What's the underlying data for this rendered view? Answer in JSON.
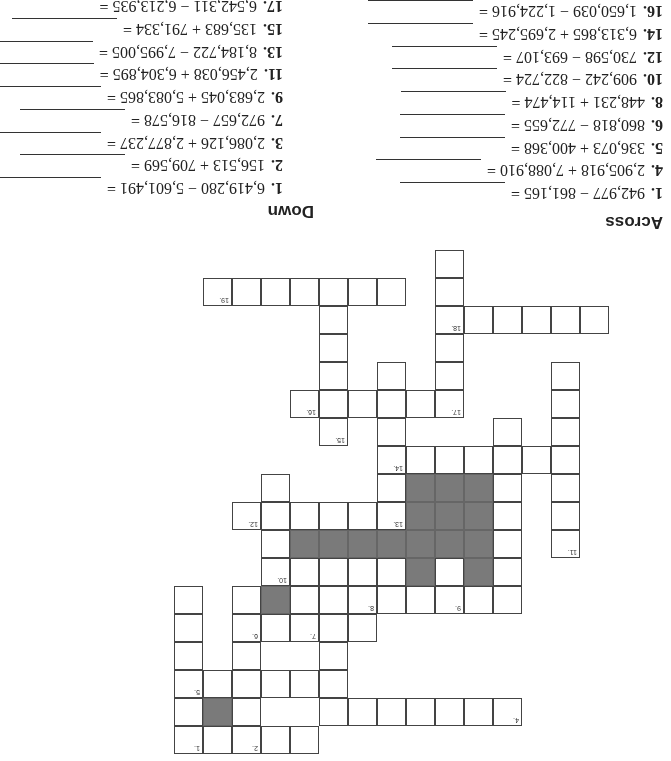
{
  "headings": {
    "across": "Across",
    "down": "Down"
  },
  "across": [
    {
      "num": "1.",
      "expr": "942,977 − 861,165 ="
    },
    {
      "num": "4.",
      "expr": "2,905,918 + 7,088,910 ="
    },
    {
      "num": "5.",
      "expr": "336,073 + 400,368 ="
    },
    {
      "num": "6.",
      "expr": "860,818 − 772,655 ="
    },
    {
      "num": "8.",
      "expr": "448,231 + 114,474 ="
    },
    {
      "num": "10.",
      "expr": "909,242 − 822,724 ="
    },
    {
      "num": "12.",
      "expr": "730,598 − 693,107 ="
    },
    {
      "num": "14.",
      "expr": "6,313,865 + 2,695,245 ="
    },
    {
      "num": "16.",
      "expr": "1,650,039 − 1,224,916 ="
    },
    {
      "num": "18.",
      "expr": "718,419 − 347,552 ="
    },
    {
      "num": "19.",
      "expr": "5,947,045 + 3,795,684 ="
    }
  ],
  "down": [
    {
      "num": "1.",
      "expr": "6,419,280 − 5,601,491 ="
    },
    {
      "num": "2.",
      "expr": "156,513 + 709,569 ="
    },
    {
      "num": "3.",
      "expr": "2,086,126 + 2,877,237 ="
    },
    {
      "num": "7.",
      "expr": "972,657 − 816,578 ="
    },
    {
      "num": "9.",
      "expr": "2,683,045 + 5,083,865 ="
    },
    {
      "num": "11.",
      "expr": "2,456,038 + 6,304,895 ="
    },
    {
      "num": "13.",
      "expr": "8,184,722 − 7,995,005 ="
    },
    {
      "num": "15.",
      "expr": "135,683 + 791,334 ="
    },
    {
      "num": "17.",
      "expr": "6,542,311 − 6,213,935 ="
    }
  ],
  "grid": {
    "cells": [
      [
        14,
        0,
        "1"
      ],
      [
        13,
        0,
        ""
      ],
      [
        12,
        0,
        "2"
      ],
      [
        11,
        0,
        ""
      ],
      [
        10,
        0,
        ""
      ],
      [
        14,
        1,
        ""
      ],
      [
        13,
        1,
        "#"
      ],
      [
        12,
        1,
        ""
      ],
      [
        9,
        1,
        ""
      ],
      [
        8,
        1,
        ""
      ],
      [
        7,
        1,
        ""
      ],
      [
        6,
        1,
        ""
      ],
      [
        5,
        1,
        ""
      ],
      [
        4,
        1,
        ""
      ],
      [
        3,
        1,
        "4"
      ],
      [
        14,
        2,
        "5"
      ],
      [
        13,
        2,
        ""
      ],
      [
        12,
        2,
        ""
      ],
      [
        11,
        2,
        ""
      ],
      [
        10,
        2,
        ""
      ],
      [
        9,
        2,
        ""
      ],
      [
        14,
        3,
        ""
      ],
      [
        12,
        3,
        ""
      ],
      [
        9,
        3,
        ""
      ],
      [
        14,
        4,
        ""
      ],
      [
        12,
        4,
        "6"
      ],
      [
        11,
        4,
        ""
      ],
      [
        10,
        4,
        "7"
      ],
      [
        9,
        4,
        ""
      ],
      [
        8,
        4,
        ""
      ],
      [
        9,
        4,
        ""
      ],
      [
        14,
        5,
        ""
      ],
      [
        12,
        5,
        ""
      ],
      [
        11,
        5,
        "#"
      ],
      [
        10,
        5,
        ""
      ],
      [
        9,
        5,
        ""
      ],
      [
        8,
        5,
        "8"
      ],
      [
        7,
        5,
        ""
      ],
      [
        6,
        5,
        ""
      ],
      [
        5,
        5,
        "9"
      ],
      [
        4,
        5,
        ""
      ],
      [
        3,
        5,
        ""
      ],
      [
        11,
        6,
        "10"
      ],
      [
        10,
        6,
        ""
      ],
      [
        9,
        6,
        ""
      ],
      [
        8,
        6,
        ""
      ],
      [
        7,
        6,
        ""
      ],
      [
        6,
        6,
        "#"
      ],
      [
        5,
        6,
        ""
      ],
      [
        4,
        6,
        "#"
      ],
      [
        3,
        6,
        ""
      ],
      [
        11,
        7,
        ""
      ],
      [
        10,
        7,
        "#"
      ],
      [
        9,
        7,
        "#"
      ],
      [
        8,
        7,
        "#"
      ],
      [
        7,
        7,
        "#"
      ],
      [
        6,
        7,
        "#"
      ],
      [
        5,
        7,
        "#"
      ],
      [
        4,
        7,
        "#"
      ],
      [
        3,
        7,
        ""
      ],
      [
        1,
        7,
        "11"
      ],
      [
        12,
        8,
        "12"
      ],
      [
        11,
        8,
        ""
      ],
      [
        10,
        8,
        ""
      ],
      [
        9,
        8,
        ""
      ],
      [
        8,
        8,
        ""
      ],
      [
        7,
        8,
        "13"
      ],
      [
        6,
        8,
        "#"
      ],
      [
        5,
        8,
        "#"
      ],
      [
        4,
        8,
        "#"
      ],
      [
        3,
        8,
        ""
      ],
      [
        1,
        8,
        ""
      ],
      [
        11,
        9,
        ""
      ],
      [
        7,
        9,
        ""
      ],
      [
        6,
        9,
        "#"
      ],
      [
        5,
        9,
        "#"
      ],
      [
        4,
        9,
        "#"
      ],
      [
        3,
        9,
        ""
      ],
      [
        1,
        9,
        ""
      ],
      [
        7,
        10,
        "14"
      ],
      [
        6,
        10,
        ""
      ],
      [
        5,
        10,
        ""
      ],
      [
        4,
        10,
        ""
      ],
      [
        3,
        10,
        ""
      ],
      [
        2,
        10,
        ""
      ],
      [
        1,
        10,
        ""
      ],
      [
        9,
        11,
        "15"
      ],
      [
        7,
        11,
        ""
      ],
      [
        3,
        11,
        ""
      ],
      [
        1,
        11,
        ""
      ],
      [
        10,
        12,
        "16"
      ],
      [
        9,
        12,
        ""
      ],
      [
        8,
        12,
        ""
      ],
      [
        7,
        12,
        ""
      ],
      [
        6,
        12,
        ""
      ],
      [
        5,
        12,
        "17"
      ],
      [
        1,
        12,
        ""
      ],
      [
        9,
        13,
        ""
      ],
      [
        7,
        13,
        ""
      ],
      [
        5,
        13,
        ""
      ],
      [
        1,
        13,
        ""
      ],
      [
        9,
        14,
        ""
      ],
      [
        5,
        14,
        ""
      ],
      [
        9,
        15,
        ""
      ],
      [
        5,
        15,
        "18"
      ],
      [
        4,
        15,
        ""
      ],
      [
        3,
        15,
        ""
      ],
      [
        2,
        15,
        ""
      ],
      [
        1,
        15,
        ""
      ],
      [
        0,
        15,
        ""
      ],
      [
        13,
        16,
        "19"
      ],
      [
        12,
        16,
        ""
      ],
      [
        11,
        16,
        ""
      ],
      [
        10,
        16,
        ""
      ],
      [
        9,
        16,
        ""
      ],
      [
        8,
        16,
        ""
      ],
      [
        7,
        16,
        ""
      ],
      [
        5,
        16,
        ""
      ],
      [
        5,
        17,
        ""
      ]
    ]
  }
}
